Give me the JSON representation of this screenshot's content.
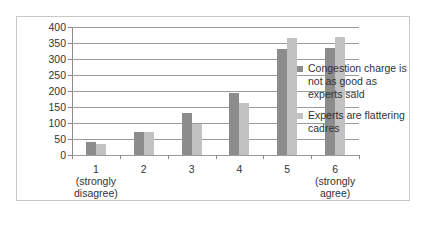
{
  "chart_data": {
    "type": "bar",
    "title": "",
    "xlabel": "",
    "ylabel": "",
    "ylim": [
      0,
      400
    ],
    "yticks": [
      0,
      50,
      100,
      150,
      200,
      250,
      300,
      350,
      400
    ],
    "grid": true,
    "legend_position": "right",
    "categories": [
      "1 (strongly disagree)",
      "2",
      "3",
      "4",
      "5",
      "6 (strongly agree)"
    ],
    "category_lines": [
      [
        "1",
        "(strongly",
        "disagree)"
      ],
      [
        "2"
      ],
      [
        "3"
      ],
      [
        "4"
      ],
      [
        "5"
      ],
      [
        "6",
        "(strongly",
        "agree)"
      ]
    ],
    "series": [
      {
        "name": "Congestion charge is not as good as experts said",
        "color": "#8c8c8c",
        "values": [
          40,
          73,
          130,
          195,
          331,
          335
        ]
      },
      {
        "name": "Experts are flattering cadres",
        "color": "#c2c2c2",
        "values": [
          33,
          73,
          97,
          163,
          366,
          370
        ]
      }
    ]
  },
  "legend": {
    "items": [
      {
        "label": "Congestion charge is not as good as experts said",
        "color": "#8c8c8c"
      },
      {
        "label": "Experts are flattering cadres",
        "color": "#c2c2c2"
      }
    ]
  }
}
